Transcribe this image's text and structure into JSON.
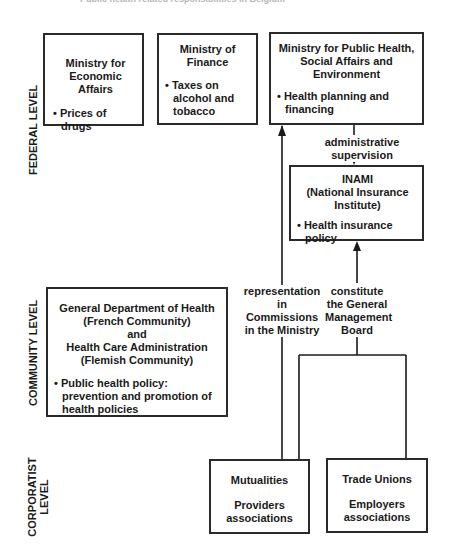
{
  "header": {
    "title": "Public health related responsibilities in Belgium"
  },
  "levels": {
    "federal": "FEDERAL LEVEL",
    "community": "COMMUNITY LEVEL",
    "corporatist_line1": "CORPORATIST",
    "corporatist_line2": "LEVEL"
  },
  "boxes": {
    "economic_affairs": {
      "title_line1": "Ministry for",
      "title_line2": "Economic Affairs",
      "bullets": [
        "Prices of drugs"
      ]
    },
    "finance": {
      "title_line1": "Ministry of",
      "title_line2": "Finance",
      "bullets": [
        "Taxes on alcohol and tobacco"
      ]
    },
    "public_health": {
      "title_line1": "Ministry for Public Health,",
      "title_line2": "Social Affairs and",
      "title_line3": "Environment",
      "bullets": [
        "Health planning and financing"
      ]
    },
    "inami": {
      "title_line1": "INAMI",
      "title_line2": "(National Insurance",
      "title_line3": "Institute)",
      "bullets": [
        "Health insurance policy"
      ]
    },
    "community": {
      "title_line1": "General Department of Health",
      "title_line2": "(French Community)",
      "title_line3": "and",
      "title_line4": "Health Care Administration",
      "title_line5": "(Flemish Community)",
      "bullets": [
        "Public health policy: prevention and promotion of health policies"
      ]
    },
    "mutualities": {
      "line1": "Mutualities",
      "line2": "Providers",
      "line3": "associations"
    },
    "trade_unions": {
      "line1": "Trade Unions",
      "line2": "Employers",
      "line3": "associations"
    }
  },
  "edges": {
    "administrative_supervision": "administrative supervision",
    "representation": {
      "line1": "representation",
      "line2": "in",
      "line3": "Commissions",
      "line4": "in the Ministry"
    },
    "constitute": {
      "line1": "constitute",
      "line2": "the General",
      "line3": "Management",
      "line4": "Board"
    }
  },
  "colors": {
    "ink": "#1a1a1a",
    "background": "#ffffff"
  }
}
